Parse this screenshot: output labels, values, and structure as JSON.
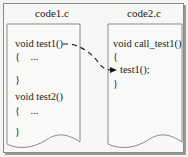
{
  "diagram": {
    "files": [
      {
        "name": "code1.c",
        "lines": [
          "void test1()",
          "{    ...",
          "}",
          "void test2()",
          "{    ...",
          "}"
        ]
      },
      {
        "name": "code2.c",
        "lines": [
          "void call_test1()",
          "{",
          "test1();",
          "}"
        ]
      }
    ],
    "link": {
      "from": "void test1()",
      "to": "test1();",
      "style": "dashed-arrow"
    },
    "colors": {
      "border": "#8a8a8a",
      "text": "#1a1a1a",
      "background": "#f7f7f5"
    }
  }
}
